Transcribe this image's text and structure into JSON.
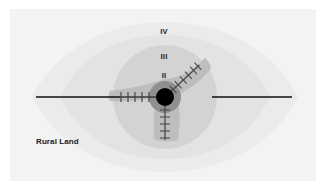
{
  "figure": {
    "canvas": {
      "width": 326,
      "height": 190
    },
    "background_color": "#ffffff",
    "panel": {
      "name": "diagram-panel",
      "fill": "#f3f3f3",
      "x": 10,
      "y": 9,
      "width": 306,
      "height": 172
    },
    "labels": {
      "zone_iv": "IV",
      "zone_iii": "III",
      "zone_ii": "II",
      "rural_land": "Rural Land"
    },
    "label_positions": {
      "zone_iv": {
        "x": 164,
        "y": 32
      },
      "zone_iii": {
        "x": 164,
        "y": 57
      },
      "zone_ii": {
        "x": 164,
        "y": 76
      },
      "rural_land": {
        "x": 36,
        "y": 142
      }
    },
    "center": {
      "x": 165,
      "y": 97
    },
    "zones": [
      {
        "id": "rural-land",
        "label": "Rural Land",
        "shape": "lens",
        "fill": "#ebebeb",
        "half_width": 133,
        "half_height": 48
      },
      {
        "id": "zone-iv",
        "label": "IV",
        "shape": "lens",
        "fill": "#e2e2e2",
        "half_width": 105,
        "half_height": 62
      },
      {
        "id": "zone-iii",
        "label": "III",
        "shape": "circle",
        "fill": "#d2d2d2",
        "radius": 52
      },
      {
        "id": "zone-ii",
        "label": "II",
        "shape": "triskelion",
        "fill": "#bcbcbc",
        "lobes": 3,
        "lobe_reach": 50
      },
      {
        "id": "zone-i",
        "label": "I",
        "shape": "circle",
        "fill": "#8f8f8f",
        "radius": 16
      },
      {
        "id": "city-core",
        "label": "City core",
        "shape": "circle",
        "fill": "#000000",
        "radius": 9
      }
    ],
    "corridors": [
      {
        "id": "highway-west",
        "type": "solid-line",
        "color": "#111111",
        "from": {
          "x": 36,
          "y": 97
        },
        "to": {
          "x": 118,
          "y": 97
        },
        "ticks": false
      },
      {
        "id": "highway-east",
        "type": "solid-line",
        "color": "#111111",
        "from": {
          "x": 212,
          "y": 97
        },
        "to": {
          "x": 292,
          "y": 97
        },
        "ticks": false
      },
      {
        "id": "rail-west",
        "type": "railway",
        "color": "#444444",
        "from": {
          "x": 118,
          "y": 97
        },
        "to": {
          "x": 156,
          "y": 97
        },
        "ticks": true,
        "tick_count": 6
      },
      {
        "id": "rail-northeast",
        "type": "railway",
        "color": "#555555",
        "from": {
          "x": 174,
          "y": 89
        },
        "to": {
          "x": 207,
          "y": 58
        },
        "ticks": true,
        "tick_count": 6
      },
      {
        "id": "rail-south",
        "type": "railway",
        "color": "#555555",
        "from": {
          "x": 165,
          "y": 108
        },
        "to": {
          "x": 165,
          "y": 143
        },
        "ticks": true,
        "tick_count": 6
      }
    ]
  }
}
